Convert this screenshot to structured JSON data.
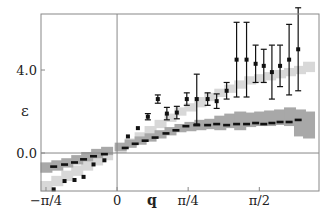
{
  "chart_data": {
    "type": "scatter",
    "title": "",
    "xlabel": "q",
    "ylabel": "ε",
    "xlim": [
      -0.84,
      2.23
    ],
    "ylim": [
      -1.83,
      6.7
    ],
    "grid": false,
    "legend": null,
    "x_ticks": [
      {
        "value": -0.785,
        "label": "−π/4"
      },
      {
        "value": 0,
        "label": "0"
      },
      {
        "value": 0.785,
        "label": "π/4"
      },
      {
        "value": 1.571,
        "label": "π/2"
      }
    ],
    "y_ticks": [
      {
        "value": 0.0,
        "label": "0.0"
      },
      {
        "value": 4.0,
        "label": "4.0"
      }
    ],
    "reference_lines": {
      "horizontal": 0.0,
      "vertical": 0.0
    },
    "bands": [
      {
        "name": "light band",
        "color": "#d8d8d8",
        "x": [
          -0.78,
          -0.66,
          -0.55,
          -0.44,
          -0.33,
          -0.22,
          -0.11,
          0.04,
          0.15,
          0.26,
          0.37,
          0.48,
          0.59,
          0.7,
          0.81,
          0.92,
          1.03,
          1.14,
          1.25,
          1.36,
          1.47,
          1.58,
          1.69,
          1.8,
          1.91,
          2.02,
          2.12
        ],
        "low": [
          -1.85,
          -1.6,
          -1.35,
          -1.1,
          -0.85,
          -0.6,
          -0.35,
          0.0,
          0.3,
          0.6,
          0.9,
          1.2,
          1.5,
          1.8,
          2.0,
          2.2,
          2.5,
          2.7,
          2.9,
          3.1,
          3.3,
          3.4,
          3.5,
          3.6,
          3.7,
          3.8,
          3.9
        ],
        "high": [
          -1.35,
          -1.1,
          -0.85,
          -0.6,
          -0.35,
          -0.1,
          0.1,
          0.4,
          0.7,
          1.0,
          1.3,
          1.6,
          1.9,
          2.2,
          2.4,
          2.7,
          2.9,
          3.1,
          3.3,
          3.5,
          3.7,
          3.8,
          3.9,
          4.0,
          4.1,
          4.2,
          4.4
        ]
      },
      {
        "name": "dark band",
        "color": "#a8a8a8",
        "x": [
          -0.78,
          -0.66,
          -0.55,
          -0.44,
          -0.33,
          -0.22,
          -0.11,
          0.04,
          0.15,
          0.26,
          0.37,
          0.48,
          0.59,
          0.7,
          0.81,
          0.92,
          1.03,
          1.14,
          1.25,
          1.36,
          1.47,
          1.58,
          1.69,
          1.8,
          1.91,
          2.02,
          2.12
        ],
        "low": [
          -0.95,
          -0.85,
          -0.7,
          -0.55,
          -0.4,
          -0.25,
          -0.1,
          0.1,
          0.25,
          0.4,
          0.55,
          0.7,
          0.85,
          1.0,
          1.05,
          1.1,
          1.15,
          1.1,
          1.2,
          1.1,
          1.25,
          1.3,
          1.3,
          1.35,
          1.3,
          0.8,
          0.7
        ],
        "high": [
          -0.45,
          -0.35,
          -0.25,
          -0.1,
          0.05,
          0.2,
          0.3,
          0.5,
          0.65,
          0.8,
          0.95,
          1.1,
          1.25,
          1.4,
          1.5,
          1.6,
          1.65,
          1.8,
          1.9,
          2.0,
          1.95,
          2.0,
          2.05,
          2.1,
          2.2,
          2.1,
          2.0
        ]
      }
    ],
    "series": [
      {
        "name": "points with error bars",
        "marker": "square",
        "color": "#111111",
        "x": [
          -0.7,
          -0.58,
          -0.47,
          -0.37,
          -0.26,
          -0.14,
          0.12,
          0.23,
          0.34,
          0.45,
          0.55,
          0.66,
          0.77,
          0.88,
          1.0,
          1.1,
          1.21,
          1.32,
          1.43,
          1.53,
          1.62,
          1.71,
          1.8,
          1.9,
          2.0
        ],
        "y": [
          -1.75,
          -1.35,
          -1.3,
          -1.15,
          -0.55,
          -0.35,
          0.8,
          1.2,
          1.75,
          2.6,
          1.9,
          1.95,
          2.6,
          2.6,
          2.6,
          2.5,
          3.0,
          4.5,
          4.5,
          4.3,
          4.2,
          3.9,
          4.2,
          4.5,
          5.0
        ],
        "err": [
          0.05,
          0.05,
          0.05,
          0.05,
          0.05,
          0.05,
          0.05,
          0.05,
          0.15,
          0.2,
          0.3,
          0.3,
          0.3,
          1.2,
          0.3,
          0.35,
          0.4,
          1.8,
          1.8,
          0.9,
          0.8,
          1.3,
          1.0,
          1.7,
          2.0
        ]
      },
      {
        "name": "dashed markers",
        "marker": "dash",
        "color": "#111111",
        "x": [
          -0.7,
          -0.58,
          -0.47,
          -0.37,
          -0.26,
          -0.14,
          0.09,
          0.2,
          0.31,
          0.42,
          0.54,
          0.65,
          0.76,
          0.88,
          1.0,
          1.1,
          1.21,
          1.32,
          1.43,
          1.53,
          1.62,
          1.71,
          1.8,
          1.9,
          2.0
        ],
        "y": [
          -0.65,
          -0.55,
          -0.45,
          -0.3,
          -0.15,
          -0.05,
          0.25,
          0.45,
          0.6,
          0.75,
          0.95,
          1.1,
          1.3,
          1.35,
          1.35,
          1.4,
          1.35,
          1.4,
          1.4,
          1.45,
          1.4,
          1.45,
          1.5,
          1.5,
          1.6
        ]
      }
    ]
  }
}
